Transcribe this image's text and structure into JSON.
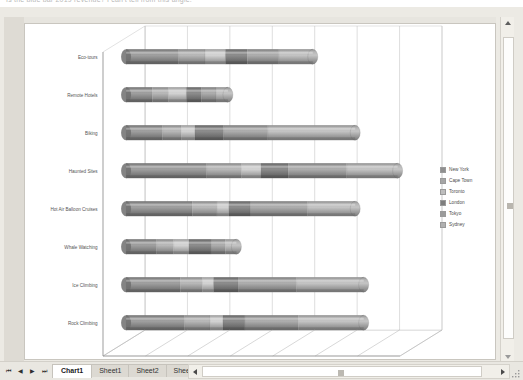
{
  "window": {
    "top_cut_text": "Is the blue bar 2019 revenue? I can't tell from this angle.",
    "sheet_tabs": [
      {
        "label": "Chart1",
        "active": true
      },
      {
        "label": "Sheet1",
        "active": false
      },
      {
        "label": "Sheet2",
        "active": false
      },
      {
        "label": "Sheet3",
        "active": false
      }
    ],
    "new_sheet_label": "⛶",
    "nav_first": "⏮",
    "nav_prev": "◀",
    "nav_next": "▶",
    "nav_last": "⏭"
  },
  "chart_data": {
    "type": "bar",
    "orientation": "horizontal",
    "stacked": true,
    "shape": "cylinder",
    "three_d": true,
    "title": "",
    "subtitle": "",
    "xlabel": "",
    "ylabel": "",
    "xlim": [
      0,
      35000
    ],
    "xticks": [
      0,
      5000,
      10000,
      15000,
      20000,
      25000,
      30000,
      35000
    ],
    "xticklabels": [
      "0",
      "5,000",
      "10,000",
      "15,000",
      "20,000",
      "25,000",
      "30,000",
      "35,000"
    ],
    "grid": true,
    "legend_position": "right",
    "categories": [
      "Eco-tours",
      "Remote Hotels",
      "Biking",
      "Haunted Sites",
      "Hot Air Balloon Cruises",
      "Whale Watching",
      "Ice Climbing",
      "Rock Climbing"
    ],
    "series": [
      {
        "name": "New York",
        "color": "#8f8f8f",
        "values": [
          6200,
          3100,
          4300,
          9500,
          7800,
          3600,
          6400,
          6900
        ]
      },
      {
        "name": "Cape Town",
        "color": "#a5a5a5",
        "values": [
          3100,
          1900,
          2200,
          4100,
          2900,
          2000,
          2600,
          3000
        ]
      },
      {
        "name": "Toronto",
        "color": "#bdbdbd",
        "values": [
          2400,
          2100,
          1600,
          2300,
          1400,
          1800,
          1300,
          1500
        ]
      },
      {
        "name": "London",
        "color": "#7e7e7e",
        "values": [
          2600,
          1800,
          3400,
          3200,
          2500,
          2600,
          2900,
          2600
        ]
      },
      {
        "name": "Tokyo",
        "color": "#9b9b9b",
        "values": [
          3700,
          1700,
          5200,
          6900,
          6800,
          1700,
          6900,
          6300
        ]
      },
      {
        "name": "Sydney",
        "color": "#b0b0b0",
        "values": [
          4000,
          1400,
          10300,
          6000,
          5600,
          1300,
          7900,
          7700
        ]
      }
    ],
    "totals": [
      22000,
      12000,
      27000,
      32000,
      27000,
      13000,
      28000,
      28000
    ]
  }
}
